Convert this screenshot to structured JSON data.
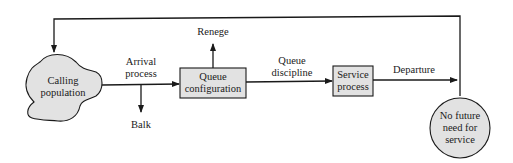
{
  "diagram": {
    "nodes": {
      "calling_population": {
        "line1": "Calling",
        "line2": "population",
        "shape": "cloud"
      },
      "queue_configuration": {
        "line1": "Queue",
        "line2": "configuration",
        "shape": "rectangle"
      },
      "service_process": {
        "line1": "Service",
        "line2": "process",
        "shape": "rectangle"
      },
      "no_future_need": {
        "line1": "No future",
        "line2": "need for",
        "line3": "service",
        "shape": "circle"
      }
    },
    "edges": {
      "arrival": {
        "line1": "Arrival",
        "line2": "process"
      },
      "balk": {
        "label": "Balk"
      },
      "renege": {
        "label": "Renege"
      },
      "queue_discipline": {
        "line1": "Queue",
        "line2": "discipline"
      },
      "departure": {
        "label": "Departure"
      },
      "feedback": {
        "label": ""
      }
    },
    "colors": {
      "node_fill": "#e2e2e2",
      "stroke": "#1a1a1a",
      "background": "#ffffff"
    }
  }
}
